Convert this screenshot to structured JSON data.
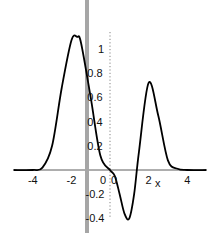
{
  "chart_data": {
    "type": "line",
    "title": "",
    "xlabel": "x",
    "ylabel": "",
    "xlim": [
      -5,
      5
    ],
    "ylim": [
      -0.45,
      1.2
    ],
    "grid": false,
    "legend": null,
    "x_ticks": [
      -4,
      -2,
      0,
      2,
      4
    ],
    "x_tick_labels": [
      "-4",
      "-2",
      "0",
      "2",
      "4"
    ],
    "y_ticks": [
      -0.4,
      -0.2,
      0,
      0.2,
      0.4,
      0.6,
      0.8,
      1
    ],
    "y_tick_labels": [
      "-0.4",
      "-0.2",
      "0",
      "0.2",
      "0.4",
      "0.6",
      "0.8",
      "1"
    ],
    "series": [
      {
        "name": "f(x)",
        "color": "#000000",
        "x": [
          -5,
          -4,
          -3.5,
          -3,
          -2.5,
          -2,
          -1.7,
          -1.5,
          -1,
          -0.5,
          0,
          0.25,
          0.5,
          0.75,
          1,
          1.25,
          1.5,
          2,
          2.5,
          3,
          3.5,
          4,
          5
        ],
        "y": [
          0,
          0.0,
          0.02,
          0.2,
          0.68,
          1.07,
          1.1,
          1.05,
          0.6,
          0.12,
          0.0,
          -0.05,
          -0.2,
          -0.36,
          -0.4,
          -0.2,
          0.15,
          0.72,
          0.45,
          0.08,
          0.01,
          0.0,
          0
        ]
      }
    ],
    "annotations": [
      {
        "type": "vertical-band",
        "x": -1.2,
        "color": "#a0a0a0"
      }
    ]
  }
}
